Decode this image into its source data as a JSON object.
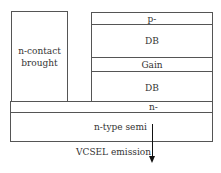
{
  "diagram": {
    "left_block": {
      "label_line1": "n-contact",
      "label_line2": "brought"
    },
    "stack": {
      "layers": [
        {
          "label": "p-"
        },
        {
          "label": "DB"
        },
        {
          "label": "Gain"
        },
        {
          "label": "DB"
        }
      ]
    },
    "n_minus_layer": {
      "label": "n-"
    },
    "substrate": {
      "label": "n-type semi"
    },
    "emission": {
      "label": "VCSEL emission"
    },
    "colors": {
      "line": "#555555",
      "arrow": "#111111",
      "text": "#333333"
    }
  }
}
